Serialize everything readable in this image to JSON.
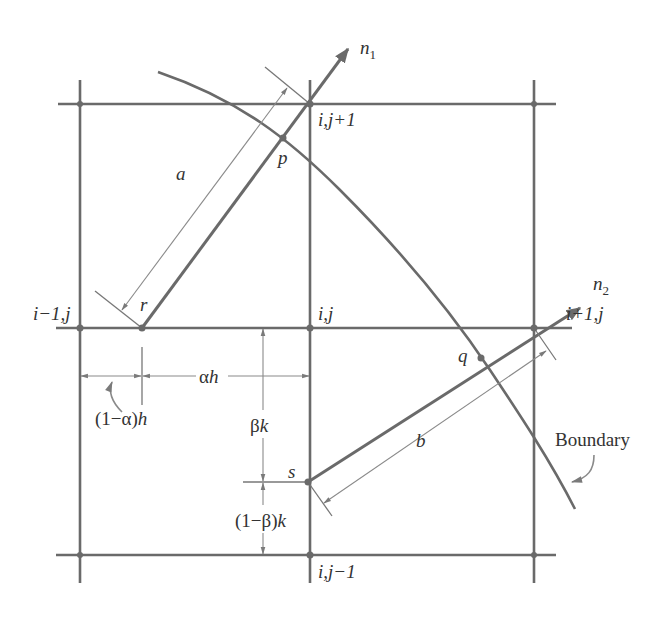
{
  "figure": {
    "colors": {
      "line": "#6a6a6a",
      "text": "#333333",
      "background": "#ffffff"
    }
  },
  "grid": {
    "x_lines": [
      80,
      310,
      534
    ],
    "y_lines": [
      104,
      328,
      555
    ]
  },
  "nodes": {
    "ij_plus1": {
      "label": "i,j+1",
      "x": 310,
      "y": 104
    },
    "im1_j": {
      "label": "i−1,j",
      "x": 80,
      "y": 328
    },
    "ij": {
      "label": "i,j",
      "x": 310,
      "y": 328
    },
    "ip1_j": {
      "label": "i+1,j",
      "x": 534,
      "y": 328
    },
    "ij_minus1": {
      "label": "i,j−1",
      "x": 310,
      "y": 555
    }
  },
  "points": {
    "p": {
      "label": "p"
    },
    "q": {
      "label": "q"
    },
    "r": {
      "label": "r"
    },
    "s": {
      "label": "s"
    }
  },
  "normals": {
    "n1": {
      "label": "n",
      "subscript": "1"
    },
    "n2": {
      "label": "n",
      "subscript": "2"
    }
  },
  "dimensions": {
    "a": "a",
    "b": "b",
    "alpha_h": {
      "greek": "α",
      "var": "h"
    },
    "one_minus_alpha_h": {
      "prefix": "(1−α)",
      "var": "h"
    },
    "beta_k": {
      "greek": "β",
      "var": "k"
    },
    "one_minus_beta_k": {
      "prefix": "(1−β)",
      "var": "k"
    }
  },
  "boundary": {
    "label": "Boundary"
  }
}
